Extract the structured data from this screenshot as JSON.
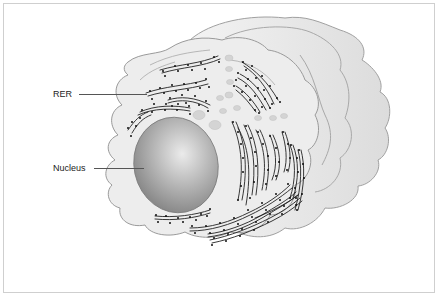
{
  "figure": {
    "type": "cell diagram",
    "labels": [
      {
        "id": "rer",
        "text": "RER"
      },
      {
        "id": "nucleus",
        "text": "Nucleus"
      }
    ],
    "colors": {
      "cytoplasm": "#ececec",
      "membrane_stroke": "#9a9a9a",
      "nucleus_dark": "#8a8a8a",
      "nucleus_light": "#e6e6e6",
      "rer_stroke": "#222222",
      "ribosome": "#111111",
      "vesicle": "#d6d6d6",
      "frame": "#cfcfcf"
    }
  }
}
